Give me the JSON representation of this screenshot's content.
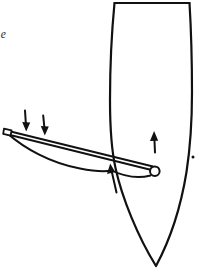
{
  "page": {
    "kind": "scanned-book-figure",
    "background_color": "#ffffff",
    "ink_color": "#111111",
    "width": 205,
    "height": 274
  },
  "caption": {
    "note": "italic caption text cropped at the left edge; only line-ending fragments are visible",
    "lines": [
      "e",
      "es",
      "h"
    ]
  },
  "figure": {
    "stroke_color": "#111111",
    "fill_color": "#ffffff",
    "hull": {
      "name": "canoe-hull",
      "description": "elongated hull outline, flat cut top edge, tapering to a point at the bottom",
      "top_edge_y": 3,
      "bottom_point": [
        156,
        266
      ],
      "left_side_top_x": 114,
      "right_side_top_x": 190
    },
    "spar": {
      "name": "outrigger-spar",
      "description": "long narrow boom crossing the hull from upper-left to lower-right, drawn as a straight top line and a curved lower line meeting at both ends",
      "left_end": [
        6,
        132
      ],
      "right_end": [
        156,
        170
      ]
    },
    "end_cap": {
      "name": "spar-end-cap",
      "description": "small rectangular block at the left end of the spar"
    },
    "ring": {
      "name": "spar-end-ring",
      "description": "small open circle (lashing eye / loop) at the right end of the spar",
      "center": [
        155,
        171
      ],
      "radius": 5
    },
    "dot": {
      "name": "hull-reference-dot",
      "description": "small solid dot inside the hull to the right",
      "center": [
        193,
        157
      ]
    },
    "arrows": [
      {
        "name": "arrow-down-left-outer",
        "direction": "down",
        "tail": [
          25,
          111
        ],
        "head": [
          26,
          131
        ]
      },
      {
        "name": "arrow-down-left-inner",
        "direction": "down",
        "tail": [
          43,
          116
        ],
        "head": [
          45,
          135
        ]
      },
      {
        "name": "arrow-up-hull",
        "direction": "up",
        "tail": [
          155,
          152
        ],
        "head": [
          154,
          131
        ]
      },
      {
        "name": "arrow-up-spar-junction",
        "direction": "up",
        "tail": [
          116,
          192
        ],
        "head": [
          110,
          163
        ]
      }
    ]
  }
}
